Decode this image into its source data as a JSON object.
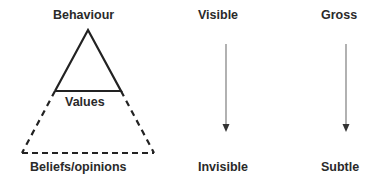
{
  "triangle": {
    "top_label": "Behaviour",
    "middle_label": "Values",
    "bottom_label": "Beliefs/opinions"
  },
  "columns": [
    {
      "top": "Visible",
      "bottom": "Invisible"
    },
    {
      "top": "Gross",
      "bottom": "Subtle"
    }
  ],
  "colors": {
    "text": "#2a2a2a",
    "triangle_line": "#222222",
    "arrow": "#888888",
    "arrowhead": "#333333"
  }
}
